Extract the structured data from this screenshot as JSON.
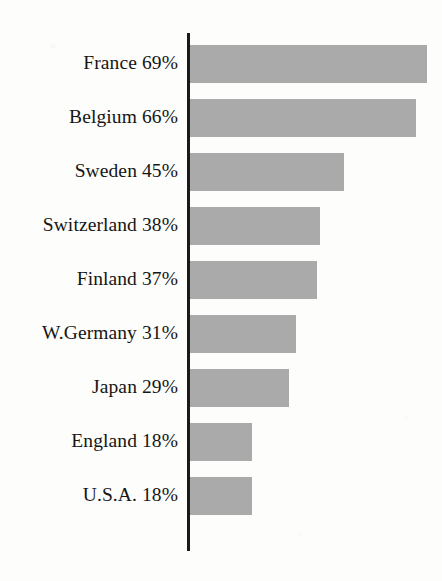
{
  "chart_data": {
    "type": "bar",
    "orientation": "horizontal",
    "title": "",
    "subtitle": "",
    "xlabel": "",
    "ylabel": "",
    "xlim": [
      0,
      74
    ],
    "grid": false,
    "legend": null,
    "value_suffix": "%",
    "categories": [
      "France",
      "Belgium",
      "Sweden",
      "Switzerland",
      "Finland",
      "W.Germany",
      "Japan",
      "England",
      "U.S.A."
    ],
    "values": [
      69,
      66,
      45,
      38,
      37,
      31,
      29,
      18,
      18
    ],
    "labels": [
      "France 69%",
      "Belgium 66%",
      "Sweden 45%",
      "Switzerland 38%",
      "Finland 37%",
      "W.Germany 31%",
      "Japan 29%",
      "England 18%",
      "U.S.A. 18%"
    ],
    "bar_color": "#ababab",
    "axis_color": "#1a1a1a",
    "background_color": "#fdfdfb",
    "text_color": "#151515"
  },
  "layout": {
    "axis_x": 187,
    "axis_top": 33,
    "axis_bottom": 551,
    "axis_width": 3,
    "bar_height": 38,
    "bar_pitch": 54,
    "first_bar_top": 45,
    "px_per_percent": 3.43,
    "label_gap": 9
  }
}
